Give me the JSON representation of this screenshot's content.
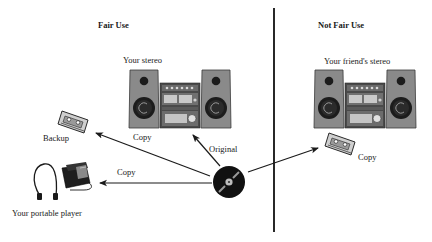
{
  "diagram": {
    "sections": [
      {
        "title": "Fair Use"
      },
      {
        "title": "Not Fair Use"
      }
    ],
    "fair_use": {
      "stereo_label": "Your stereo",
      "backup_label": "Backup",
      "portable_label": "Your portable player",
      "arrow_labels": {
        "to_stereo": "Original",
        "to_backup": "Copy",
        "to_portable": "Copy"
      }
    },
    "not_fair_use": {
      "stereo_label": "Your friend's stereo",
      "arrow_labels": {
        "to_friend_cassette": "Copy"
      }
    },
    "colors": {
      "ink": "#1a1a1a",
      "speaker_fill": "#8a8a8a",
      "speaker_edge": "#3a3a3a",
      "unit_fill": "#5c5c5c",
      "panel_fill": "#bdbdbd",
      "divider": "#111111"
    }
  }
}
